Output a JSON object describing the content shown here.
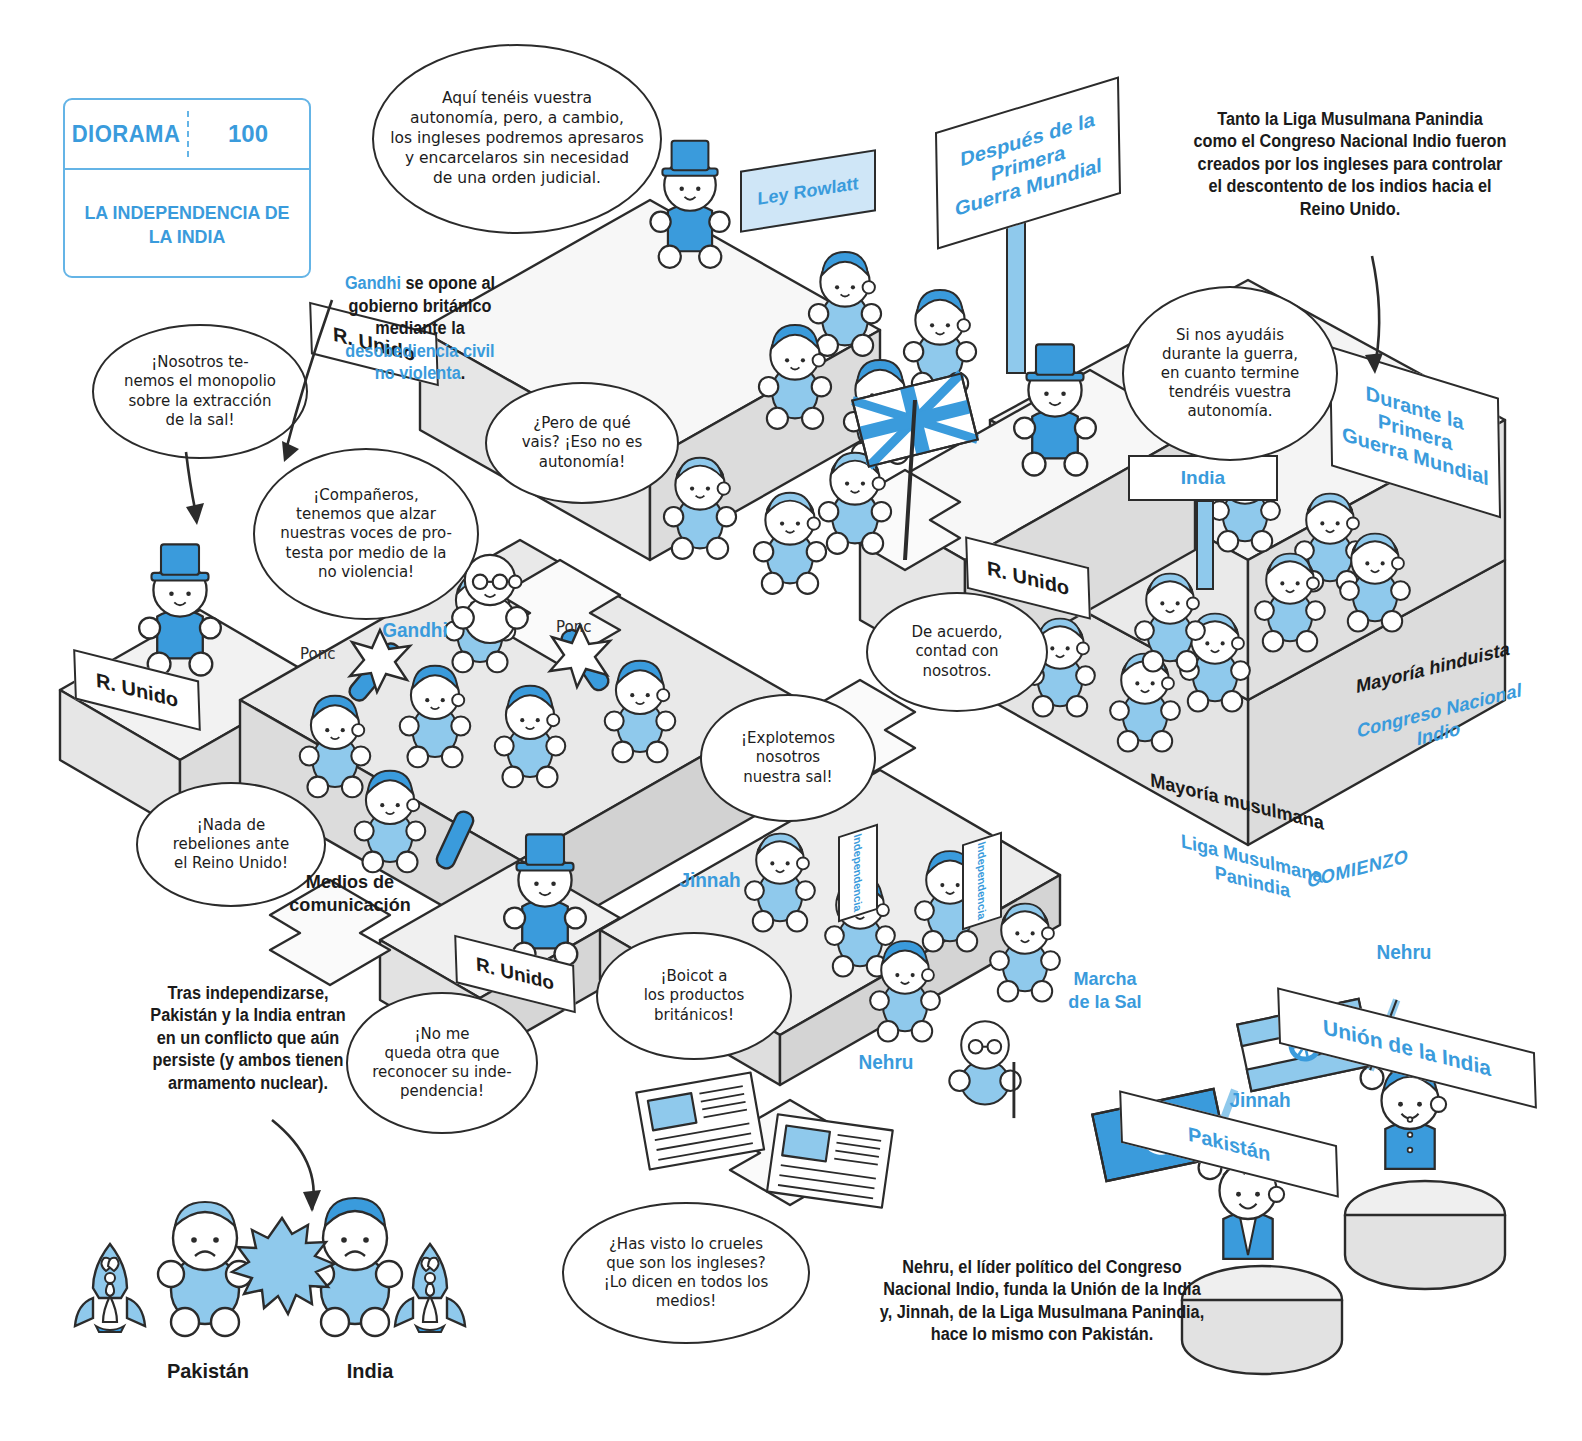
{
  "meta": {
    "colors": {
      "blue": "#3A9BDC",
      "light_blue": "#8FC9EC",
      "pale_blue": "#CFE6F7",
      "ink": "#2b2b2b",
      "floor_grey": "#DCDCDC"
    }
  },
  "title_card": {
    "label": "DIORAMA",
    "number": "100",
    "title": "LA INDEPENDENCIA\nDE LA INDIA"
  },
  "bubbles": {
    "rowlatt": "Aquí tenéis vuestra\nautonomía, pero, a cambio,\nlos ingleses podremos apresaros\ny encarcelaros sin necesidad\nde una orden judicial.",
    "salt_monopoly": "¡Nosotros te-\nnemos el monopolio\nsobre la extracción\nde la sal!",
    "gandhi_protest": "¡Compañeros,\ntenemos que alzar\nnuestras voces de pro-\ntesta por medio de la\nno violencia!",
    "but_what": "¿Pero de qué\nvais? ¡Eso no es\nautonomía!",
    "war_promise": "Si nos ayudáis\ndurante la guerra,\nen cuanto termine\ntendréis vuestra\nautonomía.",
    "agreed": "De acuerdo,\ncontad con\nnosotros.",
    "no_rebellion": "¡Nada de\nrebeliones ante\nel Reino Unido!",
    "exploit_salt": "¡Explotemos\nnosotros\nnuestra sal!",
    "boycott": "¡Boicot a\nlos productos\nbritánicos!",
    "recognize": "¡No me\nqueda otra que\nreconocer su inde-\npendencia!",
    "cruel_media": "¿Has visto lo crueles\nque son los ingleses?\n¡Lo dicen en todos los\nmedios!"
  },
  "captions": {
    "gandhi_note": {
      "segments": [
        {
          "text": "Gandhi",
          "highlight": true
        },
        {
          "text": " se opone al\ngobierno británico\nmediante la\n",
          "highlight": false
        },
        {
          "text": "desobediencia civil\nno violenta",
          "highlight": true
        },
        {
          "text": ".",
          "highlight": false
        }
      ]
    },
    "league_note": "Tanto la Liga Musulmana Panindia\ncomo el Congreso Nacional Indio fueron\ncreados por los ingleses para controlar\nel descontento de los indios hacia el\nReino Unido.",
    "conflict_note": "Tras independizarse,\nPakistán y la India entran\nen un conflicto que aún\npersiste (y ambos tienen\narmamento nuclear).",
    "founders_note": "Nehru, el líder político del Congreso\nNacional Indio, funda la Unión de la India\ny, Jinnah, de la Liga Musulmana Panindia,\nhace lo mismo con Pakistán."
  },
  "signs": [
    {
      "id": "ley-rowlatt",
      "text": "Ley Rowlatt"
    },
    {
      "id": "r-unido-top",
      "text": "R. Unido"
    },
    {
      "id": "despues-primera-guerra",
      "text": "Después de la Primera\nGuerra Mundial"
    },
    {
      "id": "durante-primera-guerra",
      "text": "Durante la Primera\nGuerra Mundial"
    },
    {
      "id": "india",
      "text": "India"
    },
    {
      "id": "r-unido-mid",
      "text": "R. Unido"
    },
    {
      "id": "r-unido-left",
      "text": "R. Unido"
    },
    {
      "id": "r-unido-low",
      "text": "R. Unido"
    },
    {
      "id": "independencia-1",
      "text": "Independencia"
    },
    {
      "id": "independencia-2",
      "text": "Independencia"
    },
    {
      "id": "union-de-la-india",
      "text": "Unión de la India"
    },
    {
      "id": "pakistan-sign",
      "text": "Pakistán"
    }
  ],
  "floor_labels": {
    "mayoria_musulmana": "Mayoría musulmana",
    "mayoria_hinduista": "Mayoría hinduista",
    "liga_musulmana": "Liga Musulmana\nPanindia",
    "congreso_nacional": "Congreso Nacional\nIndio",
    "comienzo": "COMIENZO"
  },
  "character_labels": {
    "gandhi": "Gandhi",
    "jinnah_crowd": "Jinnah",
    "nehru_crowd": "Nehru",
    "jinnah_flag": "Jinnah",
    "nehru_flag": "Nehru",
    "marcha_sal": "Marcha\nde la Sal",
    "medios": "Medios de\ncomunicación",
    "ponc_1": "Ponc",
    "ponc_2": "Ponc"
  },
  "bottom_scene": {
    "left_country": "Pakistán",
    "right_country": "India",
    "versus": "VS"
  }
}
